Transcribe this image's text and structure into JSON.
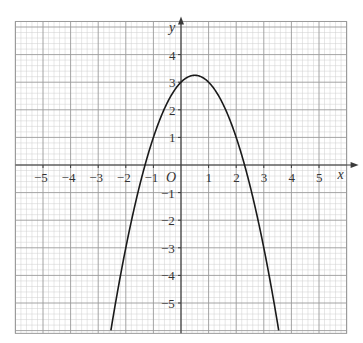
{
  "chart_data": {
    "type": "line",
    "title": "",
    "xlabel": "x",
    "ylabel": "y",
    "origin_label": "O",
    "function": "y = 3 + x - x^2",
    "xlim": [
      -6.0,
      6.0
    ],
    "ylim": [
      -6.1,
      5.2
    ],
    "grid": true,
    "grid_minor_per_unit": 5,
    "x_ticks": [
      -5,
      -4,
      -3,
      -2,
      -1,
      1,
      2,
      3,
      4,
      5
    ],
    "x_tick_labels": [
      "−5",
      "−4",
      "−3",
      "−2",
      "−1",
      "1",
      "2",
      "3",
      "4",
      "5"
    ],
    "y_ticks": [
      -5,
      -4,
      -3,
      -2,
      -1,
      1,
      2,
      3,
      4
    ],
    "y_tick_labels": [
      "−5",
      "−4",
      "−3",
      "−2",
      "−1",
      "1",
      "2",
      "3",
      "4"
    ],
    "series": [
      {
        "name": "parabola",
        "x": [
          -2.54,
          -2,
          -1.5,
          -1.3,
          -1,
          -0.5,
          0,
          0.5,
          1,
          1.5,
          2,
          2.3,
          2.5,
          3,
          3.54
        ],
        "y": [
          -6.0,
          -3.0,
          -0.75,
          0.0,
          1.0,
          2.25,
          3.0,
          3.25,
          3.0,
          2.25,
          1.0,
          0.0,
          -0.75,
          -3.0,
          -6.0
        ]
      }
    ],
    "annotations": {
      "vertex": [
        0.5,
        3.25
      ],
      "roots": [
        -1.3,
        2.3
      ],
      "y_intercept": 3
    }
  },
  "colors": {
    "minor_grid": "#cfcfcf",
    "major_grid": "#9a9a9a",
    "axis": "#3a3a3a",
    "curve": "#1a1a1a"
  }
}
